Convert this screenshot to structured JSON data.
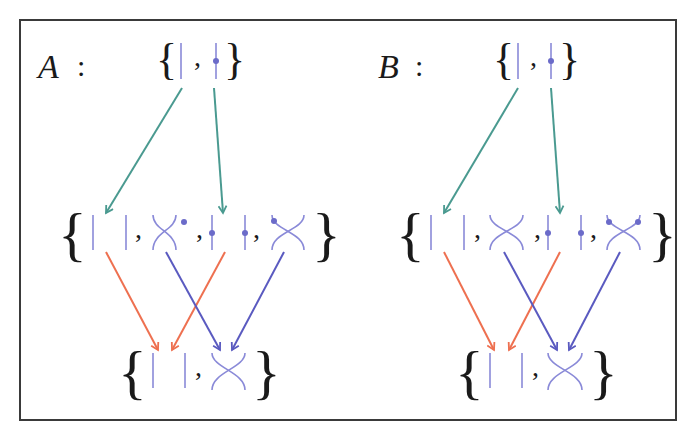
{
  "figure": {
    "frame_color": "#3a3a3a",
    "colors": {
      "strand": "#8a8ad8",
      "dot": "#6b6bc9",
      "teal_arrow": "#4a9a90",
      "orange_arrow": "#ee7050",
      "blue_arrow": "#5a5ac0"
    },
    "panels": [
      {
        "label": "A",
        "colon": ":",
        "top_set": [
          "strand",
          "dotted-strand"
        ],
        "middle_set": [
          "two-strands",
          "crossing-dot-upper-right",
          "two-dotted-strands",
          "crossing-dot-upper-left"
        ],
        "bottom_set": [
          "two-strands",
          "crossing"
        ],
        "arrows": [
          {
            "from": "top.strand",
            "to": "middle.two-strands",
            "color": "teal"
          },
          {
            "from": "top.dotted-strand",
            "to": "middle.two-dotted-strands",
            "color": "teal"
          },
          {
            "from": "middle.two-strands",
            "to": "bottom.two-strands",
            "color": "orange"
          },
          {
            "from": "middle.two-dotted-strands",
            "to": "bottom.two-strands",
            "color": "orange"
          },
          {
            "from": "middle.crossing-1",
            "to": "bottom.crossing",
            "color": "blue"
          },
          {
            "from": "middle.crossing-2",
            "to": "bottom.crossing",
            "color": "blue"
          }
        ]
      },
      {
        "label": "B",
        "colon": ":",
        "top_set": [
          "strand",
          "dotted-strand"
        ],
        "middle_set": [
          "two-strands",
          "crossing",
          "two-dotted-strands",
          "crossing-dots-both-upper"
        ],
        "bottom_set": [
          "two-strands",
          "crossing"
        ],
        "arrows": [
          {
            "from": "top.strand",
            "to": "middle.two-strands",
            "color": "teal"
          },
          {
            "from": "top.dotted-strand",
            "to": "middle.two-dotted-strands",
            "color": "teal"
          },
          {
            "from": "middle.two-strands",
            "to": "bottom.two-strands",
            "color": "orange"
          },
          {
            "from": "middle.two-dotted-strands",
            "to": "bottom.two-strands",
            "color": "orange"
          },
          {
            "from": "middle.crossing-1",
            "to": "bottom.crossing",
            "color": "blue"
          },
          {
            "from": "middle.crossing-2",
            "to": "bottom.crossing",
            "color": "blue"
          }
        ]
      }
    ],
    "glyphs": {
      "open_brace": "{",
      "close_brace": "}",
      "comma": ","
    }
  }
}
